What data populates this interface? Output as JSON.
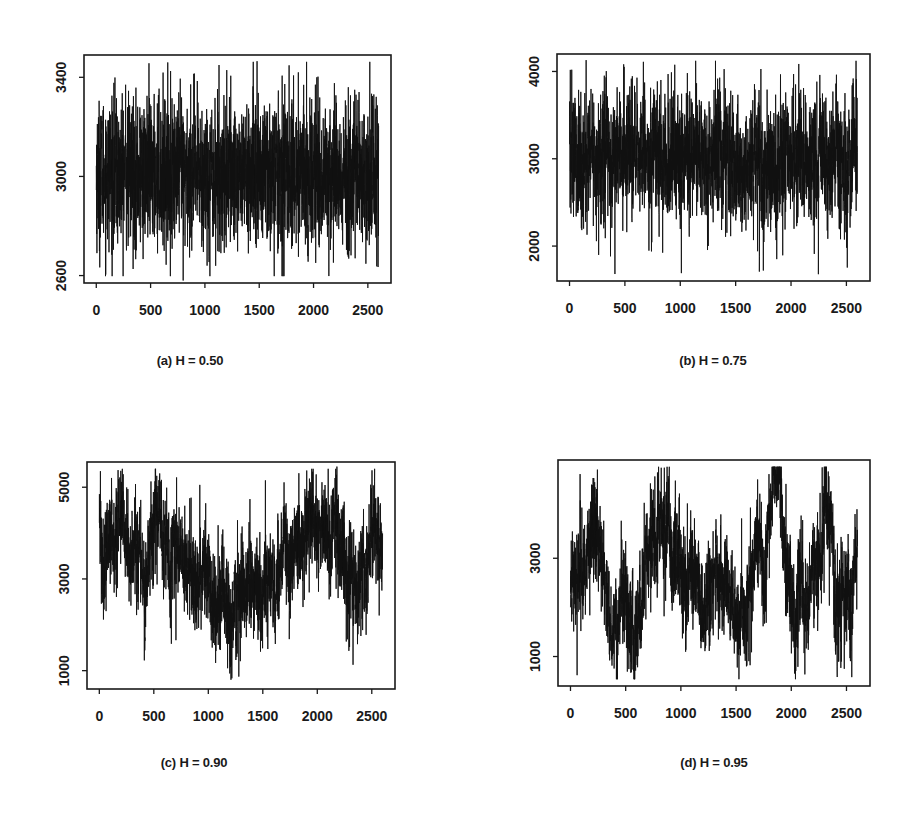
{
  "figure": {
    "background": "#ffffff",
    "line_color": "#111111"
  },
  "chart_data": [
    {
      "id": "a",
      "type": "line",
      "caption": "(a) H = 0.50",
      "hurst": 0.5,
      "xlabel": "",
      "ylabel": "",
      "x_range": [
        0,
        2600
      ],
      "x_ticks": [
        0,
        500,
        1000,
        1500,
        2000,
        2500
      ],
      "y_ticks": [
        2600,
        3000,
        3400
      ],
      "ylim": [
        2570,
        3490
      ],
      "grid": false,
      "n_points": 2600,
      "mean": 3010,
      "noise_sd": 150,
      "drift_sd": 0,
      "notable_points": [
        {
          "x": 1480,
          "y": 3465
        },
        {
          "x": 800,
          "y": 2580
        },
        {
          "x": 1860,
          "y": 2600
        },
        {
          "x": 1860,
          "y": 3420
        },
        {
          "x": 2030,
          "y": 3400
        },
        {
          "x": 2320,
          "y": 3360
        },
        {
          "x": 270,
          "y": 3370
        },
        {
          "x": 1020,
          "y": 2640
        }
      ],
      "plot_box": {
        "left": 84,
        "top": 55,
        "right": 391,
        "bottom": 283
      }
    },
    {
      "id": "b",
      "type": "line",
      "caption": "(b) H = 0.75",
      "hurst": 0.75,
      "xlabel": "",
      "ylabel": "",
      "x_range": [
        0,
        2600
      ],
      "x_ticks": [
        0,
        500,
        1000,
        1500,
        2000,
        2500
      ],
      "y_ticks": [
        2000,
        3000,
        4000
      ],
      "ylim": [
        1600,
        4200
      ],
      "grid": false,
      "n_points": 2600,
      "mean": 3000,
      "noise_sd": 370,
      "drift_sd": 120,
      "notable_points": [
        {
          "x": 150,
          "y": 4130
        },
        {
          "x": 20,
          "y": 4020
        },
        {
          "x": 920,
          "y": 3990
        },
        {
          "x": 410,
          "y": 1680
        },
        {
          "x": 1010,
          "y": 1690
        },
        {
          "x": 1750,
          "y": 1720
        },
        {
          "x": 2260,
          "y": 3960
        },
        {
          "x": 2210,
          "y": 1910
        }
      ],
      "plot_box": {
        "left": 557,
        "top": 54,
        "right": 870,
        "bottom": 281
      }
    },
    {
      "id": "c",
      "type": "line",
      "caption": "(c) H = 0.90",
      "hurst": 0.9,
      "xlabel": "",
      "ylabel": "",
      "x_range": [
        0,
        2600
      ],
      "x_ticks": [
        0,
        500,
        1000,
        1500,
        2000,
        2500
      ],
      "y_ticks": [
        1000,
        3000,
        5000
      ],
      "ylim": [
        600,
        5550
      ],
      "grid": false,
      "n_points": 2600,
      "mean": 3400,
      "noise_sd": 550,
      "drift_sd": 450,
      "trend_knots": [
        [
          0,
          3900
        ],
        [
          300,
          3500
        ],
        [
          600,
          3900
        ],
        [
          900,
          2900
        ],
        [
          1300,
          2800
        ],
        [
          1550,
          3000
        ],
        [
          1800,
          3500
        ],
        [
          2100,
          3900
        ],
        [
          2350,
          3200
        ],
        [
          2600,
          3600
        ]
      ],
      "notable_points": [
        {
          "x": 10,
          "y": 5350
        },
        {
          "x": 1280,
          "y": 870
        },
        {
          "x": 1990,
          "y": 1250
        },
        {
          "x": 2180,
          "y": 5450
        },
        {
          "x": 1990,
          "y": 5280
        },
        {
          "x": 570,
          "y": 5160
        }
      ],
      "plot_box": {
        "left": 87,
        "top": 462,
        "right": 395,
        "bottom": 689
      }
    },
    {
      "id": "d",
      "type": "line",
      "caption": "(d) H = 0.95",
      "hurst": 0.95,
      "xlabel": "",
      "ylabel": "",
      "x_range": [
        0,
        2600
      ],
      "x_ticks": [
        0,
        500,
        1000,
        1500,
        2000,
        2500
      ],
      "y_ticks": [
        1000,
        3000
      ],
      "ylim": [
        400,
        5000
      ],
      "grid": false,
      "n_points": 2600,
      "mean": 2700,
      "noise_sd": 520,
      "drift_sd": 600,
      "trend_knots": [
        [
          0,
          2300
        ],
        [
          300,
          2800
        ],
        [
          600,
          2400
        ],
        [
          700,
          3400
        ],
        [
          900,
          3600
        ],
        [
          1150,
          2900
        ],
        [
          1450,
          2200
        ],
        [
          1650,
          2800
        ],
        [
          1850,
          3800
        ],
        [
          2050,
          2300
        ],
        [
          2150,
          1500
        ],
        [
          2300,
          3700
        ],
        [
          2450,
          2300
        ],
        [
          2600,
          2700
        ]
      ],
      "notable_points": [
        {
          "x": 2280,
          "y": 4850
        },
        {
          "x": 60,
          "y": 620
        },
        {
          "x": 2060,
          "y": 790
        },
        {
          "x": 2480,
          "y": 750
        },
        {
          "x": 1850,
          "y": 4600
        },
        {
          "x": 950,
          "y": 4580
        }
      ],
      "plot_box": {
        "left": 558,
        "top": 460,
        "right": 870,
        "bottom": 686
      }
    }
  ]
}
